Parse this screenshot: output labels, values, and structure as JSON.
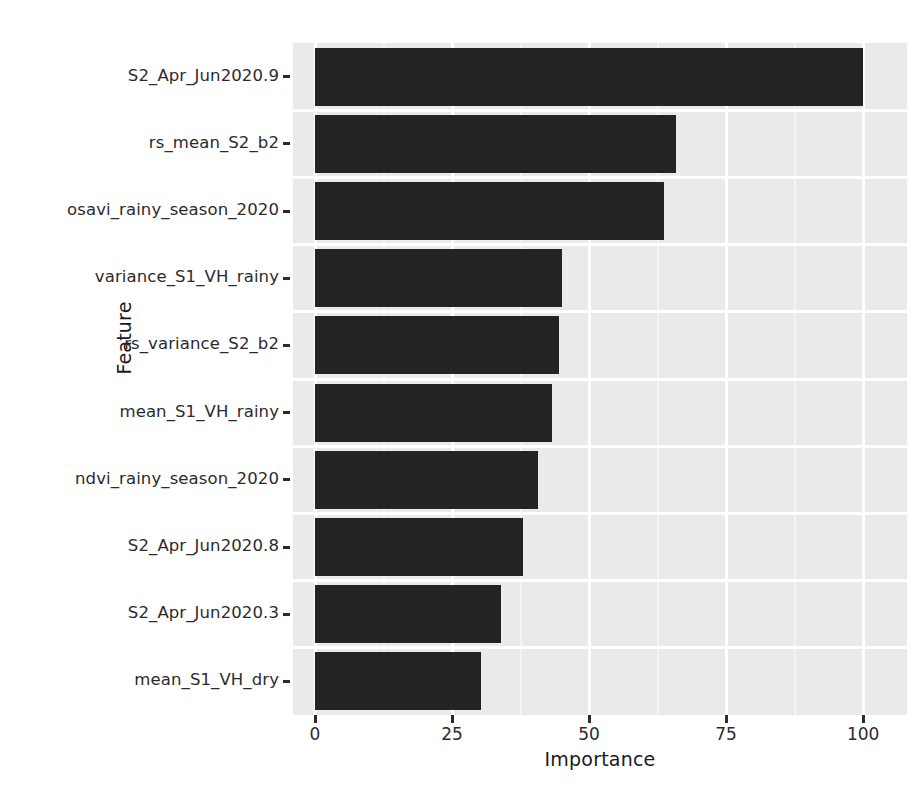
{
  "chart_data": {
    "type": "bar",
    "orientation": "horizontal",
    "title": "",
    "xlabel": "Importance",
    "ylabel": "Feature",
    "xlim": [
      0,
      108
    ],
    "xticks": [
      0,
      25,
      50,
      75,
      100
    ],
    "xtick_labels": [
      "0",
      "25",
      "50",
      "75",
      "100"
    ],
    "grid": true,
    "legend": null,
    "bar_color": "#232323",
    "panel_color": "#eaeaea",
    "gridline_color": "#ffffff",
    "categories": [
      "S2_Apr_Jun2020.9",
      "rs_mean_S2_b2",
      "osavi_rainy_season_2020",
      "variance_S1_VH_rainy",
      "rs_variance_S2_b2",
      "mean_S1_VH_rainy",
      "ndvi_rainy_season_2020",
      "S2_Apr_Jun2020.8",
      "S2_Apr_Jun2020.3",
      "mean_S1_VH_dry"
    ],
    "values": [
      100.0,
      65.8,
      63.6,
      45.0,
      44.5,
      43.2,
      40.6,
      37.9,
      33.9,
      30.2
    ]
  }
}
